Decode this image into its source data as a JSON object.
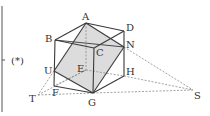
{
  "figure": {
    "marker_label": "(*)",
    "colors": {
      "edge": "#3a3a3a",
      "hidden": "#777777",
      "aux": "#9a9a9a",
      "shade": "#d9d9d9",
      "bracket": "#555555"
    },
    "points": {
      "A": {
        "label": "A",
        "x": 86,
        "y": 23
      },
      "B": {
        "label": "B",
        "x": 55,
        "y": 40
      },
      "C": {
        "label": "C",
        "x": 94,
        "y": 48
      },
      "D": {
        "label": "D",
        "x": 124,
        "y": 31
      },
      "E": {
        "label": "E",
        "x": 86,
        "y": 70
      },
      "F": {
        "label": "F",
        "x": 54,
        "y": 86
      },
      "G": {
        "label": "G",
        "x": 93,
        "y": 93
      },
      "H": {
        "label": "H",
        "x": 124,
        "y": 76
      },
      "N": {
        "label": "N",
        "x": 124,
        "y": 47
      },
      "U": {
        "label": "U",
        "x": 54,
        "y": 71
      },
      "T": {
        "label": "T",
        "x": 38,
        "y": 95
      },
      "S": {
        "label": "S",
        "x": 193,
        "y": 90
      }
    },
    "shaded_section": [
      "A",
      "N",
      "G",
      "U"
    ],
    "solid_edges": [
      [
        "A",
        "B"
      ],
      [
        "A",
        "D"
      ],
      [
        "B",
        "C"
      ],
      [
        "C",
        "D"
      ],
      [
        "B",
        "F"
      ],
      [
        "C",
        "G"
      ],
      [
        "D",
        "H"
      ],
      [
        "F",
        "G"
      ],
      [
        "G",
        "H"
      ],
      [
        "A",
        "U"
      ],
      [
        "U",
        "G"
      ],
      [
        "G",
        "N"
      ],
      [
        "N",
        "A"
      ],
      [
        "B",
        "N"
      ]
    ],
    "dashed_edges": [
      [
        "A",
        "E"
      ],
      [
        "E",
        "F"
      ],
      [
        "E",
        "H"
      ],
      [
        "U",
        "T"
      ],
      [
        "T",
        "G"
      ],
      [
        "T",
        "E"
      ],
      [
        "N",
        "S"
      ],
      [
        "H",
        "S"
      ],
      [
        "T",
        "S"
      ]
    ]
  }
}
